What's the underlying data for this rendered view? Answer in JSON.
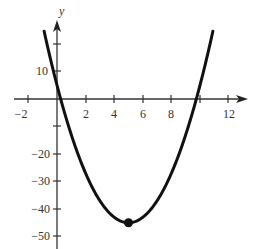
{
  "chart_data": {
    "type": "line",
    "title": "",
    "xlabel": "",
    "ylabel": "y",
    "function": "y = 2x^2 - 20x + 5",
    "x_ticks": [
      -2,
      0,
      2,
      4,
      6,
      8,
      10,
      12
    ],
    "x_tick_labels": [
      "-2",
      "2",
      "4",
      "6",
      "8",
      "12"
    ],
    "y_ticks": [
      10,
      0,
      -10,
      -20,
      -30,
      -40,
      -50
    ],
    "y_tick_labels": [
      "10",
      "-20",
      "-30",
      "-40",
      "-50"
    ],
    "xlim": [
      -3,
      14
    ],
    "ylim": [
      -52,
      30
    ],
    "grid": false,
    "series": [
      {
        "name": "parabola",
        "x": [
          -0.9,
          0,
          0.26,
          1,
          2,
          3,
          4,
          5,
          6,
          7,
          8,
          9,
          9.74,
          10,
          10.9
        ],
        "values": [
          24.6,
          5,
          0,
          -13,
          -27,
          -37,
          -43,
          -45,
          -43,
          -37,
          -27,
          -13,
          0,
          5,
          24.6
        ]
      }
    ],
    "annotations": [
      {
        "type": "point",
        "x": 5,
        "y": -45,
        "label": "vertex"
      }
    ],
    "color": "#111111"
  },
  "labels": {
    "y_axis": "y",
    "x_neg2": "−2",
    "x_2": "2",
    "x_4": "4",
    "x_6": "6",
    "x_8": "8",
    "x_12": "12",
    "y_10": "10",
    "y_neg20": "−20",
    "y_neg30": "−30",
    "y_neg40": "−40",
    "y_neg50": "−50"
  }
}
